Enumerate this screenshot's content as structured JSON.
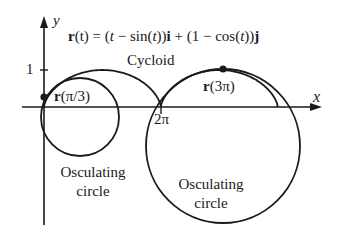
{
  "axes": {
    "x_label": "x",
    "y_label": "y",
    "y_tick": "1",
    "x_tick": "2π"
  },
  "equation": {
    "r": "r",
    "lhs_arg": "(t) = (",
    "t": "t",
    "mid1": " − sin(",
    "t2": "t",
    "mid2": "))",
    "i": "i",
    "mid3": " + (1 − cos(",
    "t3": "t",
    "mid4": "))",
    "j": "j"
  },
  "labels": {
    "cycloid": "Cycloid",
    "point1_r": "r",
    "point1_arg": "(π/3)",
    "point2_r": "r",
    "point2_arg": "(3π)",
    "osc1_line1": "Osculating",
    "osc1_line2": "circle",
    "osc2_line1": "Osculating",
    "osc2_line2": "circle"
  },
  "geometry": {
    "origin_px": [
      44,
      107
    ],
    "unit_px": 18.6,
    "small_circle": {
      "cx": 80,
      "cy": 117,
      "r": 39
    },
    "big_circle": {
      "cx": 223,
      "cy": 146,
      "r": 77
    },
    "point_pi_over_3": [
      44,
      97
    ],
    "point_3pi": [
      223,
      69
    ]
  },
  "colors": {
    "ink": "#1a1a1a",
    "background": "#ffffff"
  }
}
